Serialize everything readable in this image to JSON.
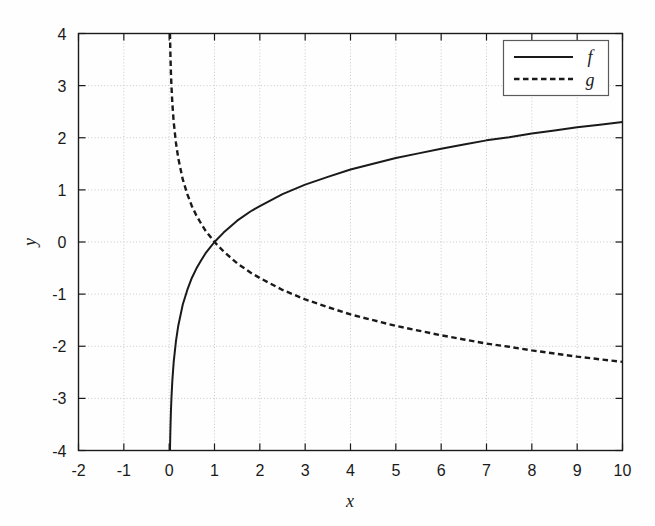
{
  "chart_data": {
    "type": "line",
    "title": "",
    "xlabel": "x",
    "ylabel": "y",
    "xlim": [
      -2,
      10
    ],
    "ylim": [
      -4,
      4
    ],
    "grid": true,
    "grid_style": "dotted",
    "grid_color": "#c8c8c8",
    "background": "#ffffff",
    "axis_color": "#1a1a1a",
    "xticks": [
      "-2",
      "-1",
      "0",
      "1",
      "2",
      "3",
      "4",
      "5",
      "6",
      "7",
      "8",
      "9",
      "10"
    ],
    "xtick_values": [
      -2,
      -1,
      0,
      1,
      2,
      3,
      4,
      5,
      6,
      7,
      8,
      9,
      10
    ],
    "yticks": [
      "4",
      "3",
      "2",
      "1",
      "0",
      "-1",
      "-2",
      "-3",
      "-4"
    ],
    "ytick_values": [
      4,
      3,
      2,
      1,
      0,
      -1,
      -2,
      -3,
      -4
    ],
    "legend_position": "upper right",
    "series": [
      {
        "name": "f",
        "label": "f",
        "style": "solid",
        "color": "#1a1a1a",
        "width": 2.0,
        "description": "natural logarithm, f(x) = ln(x)",
        "x": [
          0.018,
          0.02,
          0.025,
          0.03,
          0.04,
          0.05,
          0.07,
          0.1,
          0.15,
          0.2,
          0.3,
          0.4,
          0.5,
          0.6,
          0.7,
          0.8,
          0.9,
          1.0,
          1.2,
          1.5,
          1.8,
          2.0,
          2.5,
          3.0,
          3.5,
          4.0,
          4.5,
          5.0,
          5.5,
          6.0,
          6.5,
          7.0,
          7.5,
          8.0,
          8.5,
          9.0,
          9.5,
          10.0
        ],
        "y": [
          -4.0,
          -3.91,
          -3.69,
          -3.51,
          -3.22,
          -3.0,
          -2.66,
          -2.3,
          -1.9,
          -1.61,
          -1.2,
          -0.92,
          -0.69,
          -0.51,
          -0.36,
          -0.22,
          -0.11,
          0.0,
          0.18,
          0.41,
          0.59,
          0.69,
          0.92,
          1.1,
          1.25,
          1.39,
          1.5,
          1.61,
          1.7,
          1.79,
          1.87,
          1.95,
          2.01,
          2.08,
          2.14,
          2.2,
          2.25,
          2.3
        ]
      },
      {
        "name": "g",
        "label": "g",
        "style": "dashed",
        "color": "#1a1a1a",
        "width": 2.0,
        "description": "negated natural logarithm, g(x) = -ln(x)",
        "x": [
          0.018,
          0.02,
          0.025,
          0.03,
          0.04,
          0.05,
          0.07,
          0.1,
          0.15,
          0.2,
          0.3,
          0.4,
          0.5,
          0.6,
          0.7,
          0.8,
          0.9,
          1.0,
          1.2,
          1.5,
          1.8,
          2.0,
          2.5,
          3.0,
          3.5,
          4.0,
          4.5,
          5.0,
          5.5,
          6.0,
          6.5,
          7.0,
          7.5,
          8.0,
          8.5,
          9.0,
          9.5,
          10.0
        ],
        "y": [
          4.0,
          3.91,
          3.69,
          3.51,
          3.22,
          3.0,
          2.66,
          2.3,
          1.9,
          1.61,
          1.2,
          0.92,
          0.69,
          0.51,
          0.36,
          0.22,
          0.11,
          0.0,
          -0.18,
          -0.41,
          -0.59,
          -0.69,
          -0.92,
          -1.1,
          -1.25,
          -1.39,
          -1.5,
          -1.61,
          -1.7,
          -1.79,
          -1.87,
          -1.95,
          -2.01,
          -2.08,
          -2.14,
          -2.2,
          -2.25,
          -2.3
        ]
      }
    ],
    "annotations": [
      {
        "text": "curves intersect at (1, 0)",
        "x": 1,
        "y": 0
      }
    ]
  },
  "legend": {
    "entries": [
      {
        "label": "f",
        "style": "solid"
      },
      {
        "label": "g",
        "style": "dashed"
      }
    ]
  },
  "axes": {
    "x_title": "x",
    "y_title": "y"
  }
}
